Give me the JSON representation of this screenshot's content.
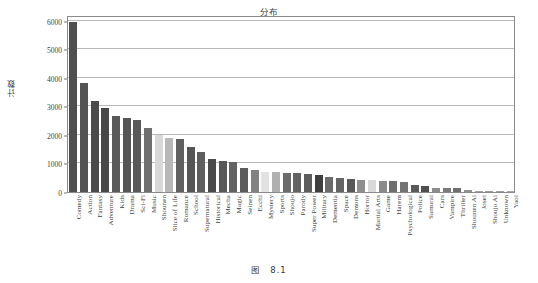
{
  "figure": {
    "caption_prefix": "图",
    "caption_number": "8.1"
  },
  "chart_data": {
    "type": "bar",
    "title": "分布",
    "xlabel": "",
    "ylabel": "计数",
    "ylim": [
      0,
      6200
    ],
    "yticks": [
      0,
      1000,
      2000,
      3000,
      4000,
      5000,
      6000
    ],
    "grid": true,
    "legend": "none",
    "categories": [
      "Comedy",
      "Action",
      "Fantasy",
      "Adventure",
      "Kids",
      "Drama",
      "Sci-Fi",
      "Music",
      "Shounen",
      "Slice of Life",
      "Romance",
      "School",
      "Supernatural",
      "Historical",
      "Mecha",
      "Magic",
      "Seinen",
      "Ecchi",
      "Mystery",
      "Sports",
      "Shoujo",
      "Parody",
      "Super Power",
      "Military",
      "Dementia",
      "Space",
      "Demons",
      "Horror",
      "Martial Arts",
      "Game",
      "Harem",
      "Psychological",
      "Police",
      "Samurai",
      "Cars",
      "Vampire",
      "Thriller",
      "Shounen Ai",
      "Josei",
      "Shoujo Ai",
      "Unknown",
      "Yaoi"
    ],
    "values": [
      5950,
      3820,
      3190,
      2940,
      2650,
      2590,
      2540,
      2240,
      2000,
      1900,
      1860,
      1580,
      1410,
      1140,
      1090,
      1060,
      840,
      770,
      700,
      690,
      680,
      650,
      640,
      590,
      520,
      490,
      450,
      430,
      420,
      380,
      370,
      360,
      250,
      210,
      130,
      140,
      140,
      80,
      50,
      50,
      40,
      30
    ],
    "bar_colors": [
      "#4f4f4f",
      "#545454",
      "#4b4b4b",
      "#474747",
      "#5a5a5a",
      "#555555",
      "#595959",
      "#6f6f6f",
      "#d8d8d8",
      "#b8b8b8",
      "#606060",
      "#565656",
      "#5e5e5e",
      "#4a4a4a",
      "#585858",
      "#636363",
      "#5b5b5b",
      "#828282",
      "#e2e2e2",
      "#b0b0b0",
      "#6b6b6b",
      "#636363",
      "#5d5d5d",
      "#3f3f3f",
      "#6a6a6a",
      "#646464",
      "#585858",
      "#8f8f8f",
      "#d9d9d9",
      "#8a8a8a",
      "#6e6e6e",
      "#737373",
      "#5a5a5a",
      "#4e4e4e",
      "#8c8c8c",
      "#7a7a7a",
      "#6d6d6d",
      "#8f8f8f",
      "#a0a0a0",
      "#9a9a9a",
      "#9e9e9e",
      "#a6a6a6"
    ]
  }
}
